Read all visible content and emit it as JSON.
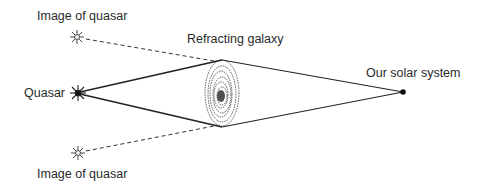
{
  "diagram": {
    "labels": {
      "image_top": "Image of quasar",
      "quasar": "Quasar",
      "image_bottom": "Image of quasar",
      "galaxy": "Refracting galaxy",
      "observer": "Our solar system"
    },
    "colors": {
      "ink": "#222222",
      "background": "#ffffff"
    },
    "points": {
      "quasar": [
        78,
        93
      ],
      "image_top": [
        77,
        37
      ],
      "image_bottom": [
        78,
        153
      ],
      "galaxy_top": [
        222,
        60
      ],
      "galaxy_bottom": [
        222,
        127
      ],
      "galaxy_center": [
        222,
        93
      ],
      "solar_system": [
        403,
        92
      ]
    }
  }
}
